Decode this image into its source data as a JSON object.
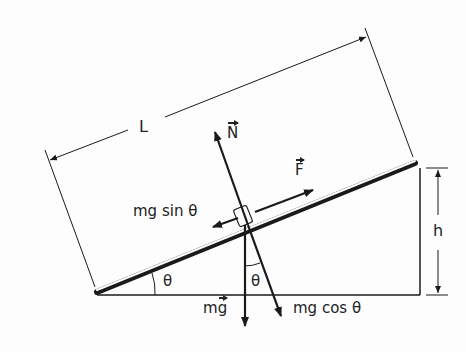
{
  "figure": {
    "type": "inclined-plane-free-body-diagram",
    "colors": {
      "line": "#1a1a1a",
      "background": "#fdfdfd"
    },
    "labels": {
      "length": "L",
      "height": "h",
      "normal_force": "N",
      "applied_force": "F",
      "parallel_component": "mg sin θ",
      "perpendicular_component": "mg cos θ",
      "weight_prefix": "m",
      "weight_vector": "g",
      "incline_angle": "θ",
      "vertical_angle": "θ"
    }
  }
}
